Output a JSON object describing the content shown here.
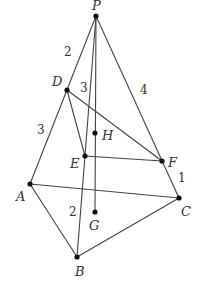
{
  "diagram": {
    "type": "tetrahedron-section",
    "points": {
      "P": {
        "label": "P",
        "x": 96,
        "y": 16,
        "lx": 92,
        "ly": 10
      },
      "D": {
        "label": "D",
        "x": 67,
        "y": 90,
        "lx": 52,
        "ly": 86
      },
      "H": {
        "label": "H",
        "x": 95,
        "y": 133,
        "lx": 102,
        "ly": 140
      },
      "E": {
        "label": "E",
        "x": 85,
        "y": 156,
        "lx": 70,
        "ly": 168
      },
      "F": {
        "label": "F",
        "x": 162,
        "y": 161,
        "lx": 168,
        "ly": 167
      },
      "A": {
        "label": "A",
        "x": 30,
        "y": 184,
        "lx": 16,
        "ly": 201
      },
      "C": {
        "label": "C",
        "x": 179,
        "y": 198,
        "lx": 181,
        "ly": 216
      },
      "G": {
        "label": "G",
        "x": 95,
        "y": 212,
        "lx": 89,
        "ly": 230
      },
      "B": {
        "label": "B",
        "x": 77,
        "y": 257,
        "lx": 75,
        "ly": 276
      }
    },
    "segment_labels": [
      {
        "text": "2",
        "x": 64,
        "y": 56,
        "between": "P-D"
      },
      {
        "text": "3",
        "x": 80,
        "y": 92,
        "between": "D-E"
      },
      {
        "text": "3",
        "x": 37,
        "y": 134,
        "between": "D-A"
      },
      {
        "text": "4",
        "x": 140,
        "y": 94,
        "between": "P-F"
      },
      {
        "text": "1",
        "x": 178,
        "y": 182,
        "between": "F-C"
      },
      {
        "text": "2",
        "x": 69,
        "y": 216,
        "between": "E-B"
      }
    ]
  }
}
